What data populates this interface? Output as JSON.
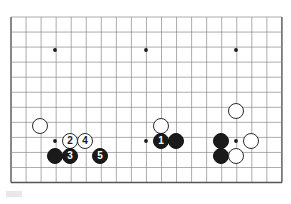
{
  "diagram": {
    "type": "go-board-diagram",
    "title": "",
    "board": {
      "cols": 19,
      "rows": 12,
      "origin_x": 11,
      "origin_y": 17,
      "spacing": 15.05,
      "line_color": "#8a8a8a",
      "edge_color": "#555555",
      "background_color": "#ffffff",
      "star_point_color": "#1a1a1a",
      "star_points": [
        {
          "x": 55,
          "y": 50
        },
        {
          "x": 146,
          "y": 50
        },
        {
          "x": 236,
          "y": 50
        },
        {
          "x": 55,
          "y": 141
        },
        {
          "x": 146,
          "y": 141
        },
        {
          "x": 236,
          "y": 141
        }
      ]
    },
    "colors": {
      "black_stone": "#1a1a1a",
      "white_stone": "#ffffff",
      "stone_outline": "#2b2b2b",
      "black_label_text": "#ffffff",
      "white_label_text": "#1a1a1a"
    },
    "stones": [
      {
        "id": "white-left-corner",
        "color": "white",
        "label": "",
        "x": 40,
        "y": 126,
        "d": 16
      },
      {
        "id": "black-left-lower",
        "color": "black",
        "label": "",
        "x": 55,
        "y": 156,
        "d": 16
      },
      {
        "id": "move-2",
        "color": "white",
        "label": "2",
        "x": 70,
        "y": 141,
        "d": 16
      },
      {
        "id": "move-4",
        "color": "white",
        "label": "4",
        "x": 85,
        "y": 141,
        "d": 16
      },
      {
        "id": "move-3",
        "color": "black",
        "label": "3",
        "x": 70,
        "y": 156,
        "d": 16
      },
      {
        "id": "move-5",
        "color": "black",
        "label": "5",
        "x": 100,
        "y": 156,
        "d": 16
      },
      {
        "id": "white-center",
        "color": "white",
        "label": "",
        "x": 161,
        "y": 126,
        "d": 16
      },
      {
        "id": "move-1",
        "color": "black",
        "label": "1",
        "x": 161,
        "y": 141,
        "d": 16
      },
      {
        "id": "black-center-right",
        "color": "black",
        "label": "",
        "x": 176,
        "y": 141,
        "d": 16
      },
      {
        "id": "white-right-upper",
        "color": "white",
        "label": "",
        "x": 236,
        "y": 111,
        "d": 16
      },
      {
        "id": "black-right-upper",
        "color": "black",
        "label": "",
        "x": 221,
        "y": 141,
        "d": 16
      },
      {
        "id": "white-right-mid",
        "color": "white",
        "label": "",
        "x": 251,
        "y": 141,
        "d": 16
      },
      {
        "id": "black-right-lower",
        "color": "black",
        "label": "",
        "x": 221,
        "y": 156,
        "d": 16
      },
      {
        "id": "white-right-lower",
        "color": "white",
        "label": "",
        "x": 236,
        "y": 156,
        "d": 16
      }
    ],
    "move_sequence": [
      {
        "number": "1",
        "color": "black"
      },
      {
        "number": "2",
        "color": "white"
      },
      {
        "number": "3",
        "color": "black"
      },
      {
        "number": "4",
        "color": "white"
      },
      {
        "number": "5",
        "color": "black"
      }
    ]
  }
}
